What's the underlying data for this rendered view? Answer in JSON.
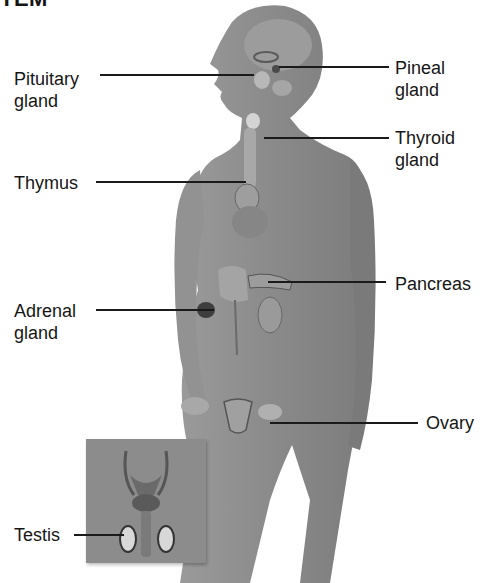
{
  "title": "TEM",
  "labels": {
    "pituitary": "Pituitary\ngland",
    "pineal": "Pineal\ngland",
    "thyroid": "Thyroid\ngland",
    "thymus": "Thymus",
    "pancreas": "Pancreas",
    "adrenal": "Adrenal\ngland",
    "ovary": "Ovary",
    "testis": "Testis"
  },
  "colors": {
    "silhouette": "#8a8a8a",
    "organ_light": "#c8c8c8",
    "organ_dark": "#4a4a4a",
    "text": "#161616"
  }
}
